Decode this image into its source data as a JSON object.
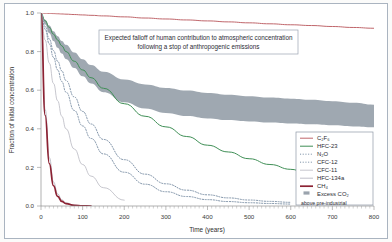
{
  "figure": {
    "background": "#fbfbfa",
    "plot_background": "#ffffff",
    "frame_color": "#aab4c0"
  },
  "titlebox": {
    "line1": "Expected falloff of human contribution to atmospheric concentration",
    "line2": "following a stop of anthropogenic emissions",
    "border_color": "#9aa4b2"
  },
  "axes": {
    "xlabel": "Time (years)",
    "ylabel": "Fraction of initial concentration",
    "xticks": [
      "0",
      "100",
      "200",
      "300",
      "400",
      "500",
      "600",
      "700",
      "800"
    ],
    "yticks": [
      "0.0",
      "0.2",
      "0.4",
      "0.6",
      "0.8",
      "1.0"
    ],
    "xlim": [
      0,
      800
    ],
    "ylim": [
      0.0,
      1.0
    ]
  },
  "legend": {
    "items": [
      {
        "label": "C₂F₆",
        "color": "#c0666b",
        "style": "solid",
        "width": 1.0
      },
      {
        "label": "HFC-23",
        "color": "#3f8f56",
        "style": "solid",
        "width": 1.0
      },
      {
        "label": "N₂O",
        "color": "#7f93a8",
        "style": "dotted",
        "width": 1.0
      },
      {
        "label": "CFC-12",
        "color": "#7f93a8",
        "style": "dotted",
        "width": 1.0
      },
      {
        "label": "CFC-11",
        "color": "#b9b9c2",
        "style": "solid",
        "width": 0.8
      },
      {
        "label": "HFC-134a",
        "color": "#b0b0bb",
        "style": "solid",
        "width": 0.8
      },
      {
        "label": "CH₄",
        "color": "#8c2233",
        "style": "solid",
        "width": 1.7
      }
    ],
    "band": {
      "label": "Excess CO₂",
      "sublabel": "above pre-industrial",
      "color": "#9aa3ad"
    },
    "border_color": "#8f98a6"
  },
  "chart_data": {
    "type": "line",
    "title": "Expected falloff of human contribution to atmospheric concentration following a stop of anthropogenic emissions",
    "xlabel": "Time (years)",
    "ylabel": "Fraction of initial concentration",
    "xlim": [
      0,
      800
    ],
    "ylim": [
      0.0,
      1.0
    ],
    "grid": false,
    "legend_position": "lower-right",
    "x": [
      0,
      10,
      20,
      30,
      40,
      50,
      60,
      80,
      100,
      120,
      150,
      200,
      250,
      300,
      350,
      400,
      450,
      500,
      550,
      600,
      650,
      700,
      750,
      800
    ],
    "series": [
      {
        "name": "C₂F₆",
        "color": "#c0666b",
        "style": "solid",
        "values": [
          1.0,
          0.999,
          0.998,
          0.997,
          0.996,
          0.995,
          0.994,
          0.992,
          0.99,
          0.988,
          0.985,
          0.98,
          0.974,
          0.969,
          0.964,
          0.959,
          0.954,
          0.949,
          0.944,
          0.939,
          0.935,
          0.93,
          0.925,
          0.921
        ]
      },
      {
        "name": "HFC-23",
        "color": "#3f8f56",
        "style": "solid",
        "values": [
          1.0,
          0.96,
          0.925,
          0.89,
          0.86,
          0.83,
          0.8,
          0.75,
          0.705,
          0.665,
          0.61,
          0.53,
          0.465,
          0.41,
          0.36,
          0.315,
          0.28,
          0.245,
          0.215,
          0.19,
          0.155,
          0.135,
          0.13,
          0.13
        ]
      },
      {
        "name": "N₂O",
        "color": "#7f93a8",
        "style": "dotted",
        "values": [
          1.0,
          0.93,
          0.865,
          0.805,
          0.75,
          0.7,
          0.65,
          0.565,
          0.49,
          0.425,
          0.345,
          0.24,
          0.165,
          0.115,
          0.082,
          0.058,
          0.042,
          0.031,
          0.024,
          0.019,
          0.016,
          0.014,
          0.012,
          0.011
        ]
      },
      {
        "name": "CFC-12",
        "color": "#7f93a8",
        "style": "dotted",
        "values": [
          1.0,
          0.915,
          0.84,
          0.77,
          0.705,
          0.645,
          0.59,
          0.495,
          0.415,
          0.35,
          0.27,
          0.175,
          0.113,
          0.074,
          0.049,
          0.033,
          0.023,
          0.017,
          0.013,
          0.01,
          0.009,
          0.008,
          0.007,
          0.007
        ]
      },
      {
        "name": "CFC-11",
        "color": "#b9b9c2",
        "style": "solid",
        "values": [
          1.0,
          0.86,
          0.74,
          0.635,
          0.545,
          0.465,
          0.4,
          0.295,
          0.215,
          0.155,
          0.095,
          0.03,
          0.009,
          0.0,
          0.0,
          0.0,
          0.0,
          0.0,
          0.0,
          0.0,
          0.0,
          0.0,
          0.0,
          0.0
        ]
      },
      {
        "name": "HFC-134a",
        "color": "#b0b0bb",
        "style": "solid",
        "values": [
          1.0,
          0.5,
          0.25,
          0.125,
          0.063,
          0.032,
          0.016,
          0.004,
          0.001,
          0.0,
          0.0,
          0.0,
          0.0,
          0.0,
          0.0,
          0.0,
          0.0,
          0.0,
          0.0,
          0.0,
          0.0,
          0.0,
          0.0,
          0.0
        ]
      },
      {
        "name": "CH₄",
        "color": "#8c2233",
        "style": "solid",
        "values": [
          1.0,
          0.47,
          0.22,
          0.105,
          0.05,
          0.024,
          0.012,
          0.003,
          0.001,
          0.0,
          0.0,
          0.0,
          0.0,
          0.0,
          0.0,
          0.0,
          0.0,
          0.0,
          0.0,
          0.0,
          0.0,
          0.0,
          0.0,
          0.0
        ]
      }
    ],
    "band_series": {
      "name": "Excess CO₂ above pre-industrial",
      "color": "#9aa3ad",
      "upper": [
        1.0,
        0.965,
        0.935,
        0.905,
        0.88,
        0.855,
        0.835,
        0.795,
        0.76,
        0.73,
        0.695,
        0.655,
        0.63,
        0.612,
        0.598,
        0.586,
        0.577,
        0.569,
        0.562,
        0.556,
        0.55,
        0.543,
        0.535,
        0.525
      ],
      "lower": [
        1.0,
        0.94,
        0.895,
        0.855,
        0.82,
        0.79,
        0.762,
        0.715,
        0.672,
        0.635,
        0.59,
        0.538,
        0.505,
        0.482,
        0.466,
        0.454,
        0.445,
        0.438,
        0.432,
        0.427,
        0.423,
        0.418,
        0.412,
        0.408
      ]
    }
  }
}
